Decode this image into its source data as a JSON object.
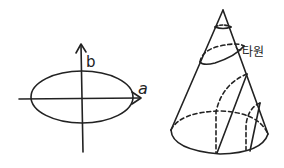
{
  "figure": {
    "ellipse_panel": {
      "axis_labels": {
        "vertical": "b",
        "horizontal": "a"
      },
      "ellipse": {
        "semi_major": "a",
        "semi_minor": "b"
      }
    },
    "cone_panel": {
      "label": "타원",
      "sections": [
        "small top circle",
        "tilted ellipse",
        "parabola",
        "hyperbola"
      ]
    },
    "colors": {
      "stroke": "#222222",
      "background": "#ffffff"
    }
  }
}
